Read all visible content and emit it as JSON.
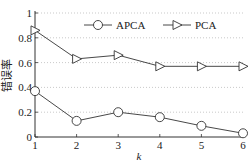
{
  "chart_data": {
    "type": "line",
    "title": "",
    "xlabel": "k",
    "ylabel": "错误率",
    "x": [
      1,
      2,
      3,
      4,
      5,
      6
    ],
    "xticks": [
      "1",
      "2",
      "3",
      "4",
      "5",
      "6"
    ],
    "yticks": [
      "0",
      "0.2",
      "0.4",
      "0.6",
      "0.8",
      "1"
    ],
    "xlim": [
      1,
      6
    ],
    "ylim": [
      0,
      1
    ],
    "grid": "horizontal dotted",
    "legend_position": "upper right",
    "series": [
      {
        "name": "APCA",
        "marker": "circle",
        "values": [
          0.37,
          0.13,
          0.2,
          0.16,
          0.09,
          0.03
        ]
      },
      {
        "name": "PCA",
        "marker": "triangle-right",
        "values": [
          0.86,
          0.63,
          0.66,
          0.57,
          0.57,
          0.57
        ]
      }
    ]
  }
}
